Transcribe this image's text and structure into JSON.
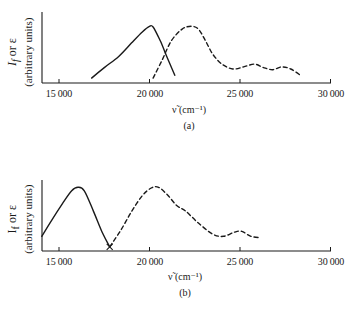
{
  "chart_data": [
    {
      "type": "line",
      "panel": "(a)",
      "title": "",
      "caption": "(a)",
      "xlabel": "ν̃ (cm⁻¹)",
      "ylabel": "I_f or ε (arbitrary units)",
      "xlim": [
        14000,
        30000
      ],
      "ylim": [
        0,
        1
      ],
      "xticks": [
        15000,
        20000,
        25000,
        30000
      ],
      "xtick_labels": [
        "15 000",
        "20 000",
        "25 000",
        "30 000"
      ],
      "yticks": [],
      "grid": false,
      "legend": null,
      "series": [
        {
          "name": "fluorescence (I_f)",
          "style": "solid",
          "x": [
            16800,
            17500,
            18300,
            19000,
            19600,
            20000,
            20200,
            20600,
            21000,
            21400
          ],
          "y": [
            0.07,
            0.22,
            0.38,
            0.57,
            0.73,
            0.81,
            0.8,
            0.6,
            0.35,
            0.11
          ]
        },
        {
          "name": "absorption (ε)",
          "style": "dashed",
          "x": [
            20200,
            20700,
            21200,
            21800,
            22300,
            22700,
            23100,
            23500,
            24000,
            24600,
            25200,
            25800,
            26300,
            26800,
            27300,
            27800,
            28400
          ],
          "y": [
            0.07,
            0.33,
            0.6,
            0.77,
            0.81,
            0.77,
            0.6,
            0.41,
            0.27,
            0.2,
            0.23,
            0.27,
            0.22,
            0.19,
            0.23,
            0.2,
            0.1
          ]
        }
      ]
    },
    {
      "type": "line",
      "panel": "(b)",
      "title": "",
      "caption": "(b)",
      "xlabel": "ν̃ (cm⁻¹)",
      "ylabel": "I_f or ε (arbitrary units)",
      "xlim": [
        14000,
        30000
      ],
      "ylim": [
        0,
        1
      ],
      "xticks": [
        15000,
        20000,
        25000,
        30000
      ],
      "xtick_labels": [
        "15 000",
        "20 000",
        "25 000",
        "30 000"
      ],
      "yticks": [],
      "grid": false,
      "legend": null,
      "series": [
        {
          "name": "fluorescence (I_f)",
          "style": "solid",
          "x": [
            14050,
            14600,
            15200,
            15700,
            16050,
            16400,
            16900,
            17400,
            17800
          ],
          "y": [
            0.21,
            0.44,
            0.68,
            0.86,
            0.91,
            0.86,
            0.57,
            0.26,
            0.06
          ]
        },
        {
          "name": "absorption (ε)",
          "style": "dashed",
          "x": [
            17800,
            18400,
            19000,
            19600,
            20100,
            20500,
            21000,
            21500,
            22000,
            22700,
            23500,
            24100,
            24700,
            25100,
            25600,
            26100
          ],
          "y": [
            0.06,
            0.29,
            0.56,
            0.79,
            0.9,
            0.91,
            0.8,
            0.65,
            0.57,
            0.4,
            0.24,
            0.21,
            0.27,
            0.28,
            0.21,
            0.19
          ]
        }
      ]
    }
  ],
  "panels": {
    "a": {
      "ylabel_main_prefix": "I",
      "ylabel_main_sub": "f",
      "ylabel_main_suffix": " or ε",
      "ylabel_units": "(arbitrary units)",
      "xlabel": "ν̃ (cm⁻¹)",
      "caption": "(a)",
      "ticks": [
        "15 000",
        "20 000",
        "25 000",
        "30 000"
      ]
    },
    "b": {
      "ylabel_main_prefix": "I",
      "ylabel_main_sub": "f",
      "ylabel_main_suffix": " or ε",
      "ylabel_units": "(arbitrary units)",
      "xlabel": "ν̃ (cm⁻¹)",
      "caption": "(b)",
      "ticks": [
        "15 000",
        "20 000",
        "25 000",
        "30 000"
      ]
    }
  },
  "colors": {
    "ink": "#1a1a1a",
    "background": "#ffffff"
  }
}
